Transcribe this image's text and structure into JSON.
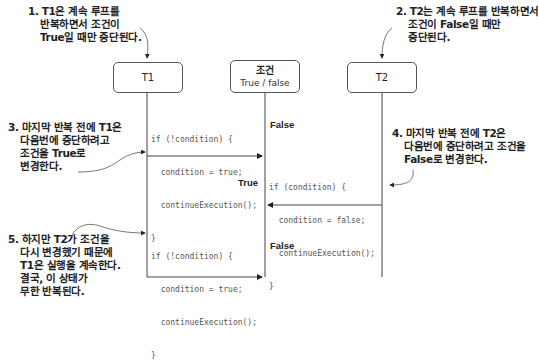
{
  "participants": {
    "t1": {
      "label": "T1"
    },
    "condition": {
      "label": "조건",
      "sublabel": "True / false"
    },
    "t2": {
      "label": "T2"
    }
  },
  "notes": {
    "n1": [
      "1. T1은 계속 루프를",
      "반복하면서 조건이",
      "True일 때만 중단된다."
    ],
    "n2": [
      "2. T2는 계속 루프를 반복하면서",
      "조건이 False일 때만",
      "중단된다."
    ],
    "n3": [
      "3. 마지막 반복 전에 T1은",
      "다음번에 중단하려고",
      "조건을 True로",
      "변경한다."
    ],
    "n4": [
      "4. 마지막 반복 전에 T2은",
      "다음번에 중단하려고 조건을",
      "False로 변경한다."
    ],
    "n5": [
      "5. 하지만 T2가 조건을",
      "다시 변경했기 때문에",
      "T1은 실행을 계속한다.",
      "결국, 이 상태가",
      "무한 반복된다."
    ]
  },
  "code_blocks": {
    "c1": [
      "if (!condition) {",
      "  condition = true;",
      "  continueExecution();",
      "}"
    ],
    "c2": [
      "if (condition) {",
      "  condition = false;",
      "  continueExecution();",
      "}"
    ],
    "c3": [
      "if (!condition) {",
      "  condition = true;",
      "  continueExecution();",
      "}"
    ]
  },
  "states": {
    "s1": "False",
    "s2": "True",
    "s3": "False"
  }
}
